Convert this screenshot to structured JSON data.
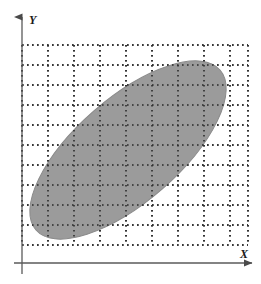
{
  "figure": {
    "title": "",
    "background_color": "#ffffff"
  },
  "axes": {
    "x": {
      "label": "X",
      "label_x": 240,
      "label_y": 258,
      "line_y": 263,
      "line_x_start": 14,
      "line_x_end": 252,
      "arrow": "right-arrow",
      "color": "#5a5a5a"
    },
    "y": {
      "label": "Y",
      "label_x": 29,
      "label_y": 24,
      "line_x": 22,
      "line_y_start": 274,
      "line_y_end": 17,
      "arrow": "up-arrow",
      "color": "#5a5a5a"
    }
  },
  "grid": {
    "style": "dotted",
    "color": "#2b2b2b",
    "dot_size": 1.6,
    "dot_gap": 3.4,
    "left": 22,
    "right": 248,
    "top": 45,
    "bottom": 245,
    "x_lines": [
      22,
      48,
      74,
      100,
      126,
      152,
      178,
      204,
      230,
      248
    ],
    "y_lines": [
      45,
      65,
      85,
      105,
      125,
      145,
      165,
      185,
      205,
      225,
      245
    ],
    "columns": 9,
    "rows": 10
  },
  "shapes": [
    {
      "name": "shaded-ellipse-region",
      "type": "ellipse",
      "center_x": 128,
      "center_y": 150,
      "semi_major": 122,
      "semi_minor": 52,
      "rotation_deg": -41,
      "fill_color": "#9b9b9b",
      "fill_opacity": 1,
      "stroke_color": "#8a8a8a",
      "stroke_width": 1,
      "description": "Shaded elliptical region tilted along the positive diagonal"
    }
  ],
  "chart_data": {
    "type": "scatter",
    "title": "",
    "xlabel": "X",
    "ylabel": "Y",
    "grid": true,
    "legend": null,
    "xlim": [
      0,
      9
    ],
    "ylim": [
      0,
      10
    ],
    "xticks": [
      0,
      1,
      2,
      3,
      4,
      5,
      6,
      7,
      8,
      9
    ],
    "yticks": [
      0,
      1,
      2,
      3,
      4,
      5,
      6,
      7,
      8,
      9,
      10
    ],
    "xtick_labels": [
      "",
      "",
      "",
      "",
      "",
      "",
      "",
      "",
      "",
      ""
    ],
    "ytick_labels": [
      "",
      "",
      "",
      "",
      "",
      "",
      "",
      "",
      "",
      "",
      ""
    ],
    "annotations": [],
    "regions": [
      {
        "name": "ellipse",
        "center": [
          4.1,
          5.6
        ],
        "semi_major": 5.1,
        "semi_minor": 2.2,
        "rotation_deg": 41,
        "fill": "#9b9b9b",
        "note": "Positively correlated elliptical support region"
      }
    ]
  }
}
